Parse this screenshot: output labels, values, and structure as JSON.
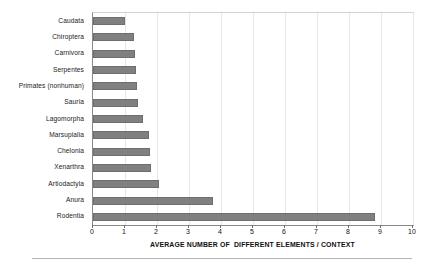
{
  "chart_data": {
    "type": "bar",
    "orientation": "horizontal",
    "title": "",
    "subtitle": "",
    "xlabel": "AVERAGE NUMBER OF  DIFFERENT ELEMENTS / CONTEXT",
    "ylabel": "",
    "xlim": [
      0,
      10
    ],
    "ylim": null,
    "grid": true,
    "grid_axis": "x",
    "legend": null,
    "legend_position": "none",
    "xticks": [
      "0",
      "1",
      "2",
      "3",
      "4",
      "5",
      "6",
      "7",
      "8",
      "9",
      "10"
    ],
    "xtick_values": [
      0,
      1,
      2,
      3,
      4,
      5,
      6,
      7,
      8,
      9,
      10
    ],
    "bar_color": "#808080",
    "bar_edge_color": "#6e6e6e",
    "plot_border_color": "#d2d2d2",
    "axis_line_color": "#8a8a8a",
    "categories": [
      "Caudata",
      "Chiroptera",
      "Carnivora",
      "Serpentes",
      "Primates (nonhuman)",
      "Sauria",
      "Lagomorpha",
      "Marsupialia",
      "Chelonia",
      "Xenarthra",
      "Artiodactyla",
      "Anura",
      "Rodentia"
    ],
    "values": [
      1.0,
      1.28,
      1.3,
      1.35,
      1.37,
      1.4,
      1.55,
      1.75,
      1.78,
      1.8,
      2.07,
      3.75,
      8.8
    ],
    "bars": [
      {
        "category": "Caudata",
        "value": 1.0
      },
      {
        "category": "Chiroptera",
        "value": 1.28
      },
      {
        "category": "Carnivora",
        "value": 1.3
      },
      {
        "category": "Serpentes",
        "value": 1.35
      },
      {
        "category": "Primates (nonhuman)",
        "value": 1.37
      },
      {
        "category": "Sauria",
        "value": 1.4
      },
      {
        "category": "Lagomorpha",
        "value": 1.55
      },
      {
        "category": "Marsupialia",
        "value": 1.75
      },
      {
        "category": "Chelonia",
        "value": 1.78
      },
      {
        "category": "Xenarthra",
        "value": 1.8
      },
      {
        "category": "Artiodactyla",
        "value": 2.07
      },
      {
        "category": "Anura",
        "value": 3.75
      },
      {
        "category": "Rodentia",
        "value": 8.8
      }
    ]
  }
}
